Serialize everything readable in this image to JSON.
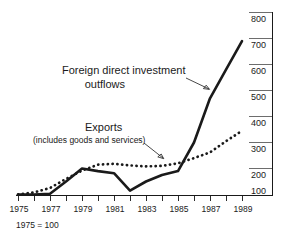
{
  "chart_data": {
    "type": "line",
    "title": "",
    "subtitle": "",
    "xlabel": "",
    "ylabel": "",
    "base_note": "1975 = 100",
    "grid": false,
    "legend_position": "inline-annotations",
    "y_axis_position": "right",
    "xlim": [
      1975,
      1989
    ],
    "ylim": [
      60,
      820
    ],
    "x_tick_labels": [
      "1975",
      "1977",
      "1979",
      "1981",
      "1983",
      "1985",
      "1987",
      "1989"
    ],
    "x_tick_values": [
      1975,
      1977,
      1979,
      1981,
      1983,
      1985,
      1987,
      1989
    ],
    "x_minor_ticks": [
      1976,
      1978,
      1980,
      1982,
      1984,
      1986,
      1988
    ],
    "y_tick_labels": [
      "800",
      "700",
      "600",
      "500",
      "400",
      "300",
      "200",
      "100"
    ],
    "y_tick_values": [
      800,
      700,
      600,
      500,
      400,
      300,
      200,
      100
    ],
    "x": [
      1975,
      1976,
      1977,
      1978,
      1979,
      1980,
      1981,
      1982,
      1983,
      1984,
      1985,
      1986,
      1987,
      1988,
      1989
    ],
    "series": [
      {
        "name": "Foreign direct investment outflows",
        "style": "solid",
        "values": [
          100,
          100,
          103,
          150,
          200,
          190,
          182,
          115,
          150,
          175,
          190,
          300,
          470,
          580,
          690
        ]
      },
      {
        "name": "Exports (includes goods and services)",
        "style": "dotted",
        "values": [
          100,
          108,
          125,
          160,
          192,
          215,
          218,
          212,
          208,
          210,
          220,
          240,
          262,
          305,
          345
        ]
      }
    ],
    "annotations": [
      {
        "id": "fdi-annotation",
        "line1": "Foreign direct investment",
        "line2": "outflows",
        "points_to_series": "Foreign direct investment outflows"
      },
      {
        "id": "exports-annotation",
        "line1": "Exports",
        "line2": "(includes goods and services)",
        "points_to_series": "Exports (includes goods and services)"
      }
    ]
  }
}
